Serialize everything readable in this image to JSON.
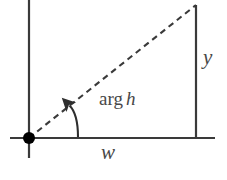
{
  "figure": {
    "background_color": "#ffffff",
    "stroke_color": "#3a3a3a",
    "text_color": "#484848"
  },
  "labels": {
    "y": "y",
    "w": "w",
    "arg_prefix": "arg",
    "arg_variable": "h"
  },
  "geometry": {
    "origin": {
      "x": 29,
      "y": 138
    },
    "vertex": {
      "x": 196,
      "y": 5
    },
    "horizontal_axis": {
      "x1": 10,
      "y1": 138,
      "x2": 215,
      "y2": 138
    },
    "vertical_axis": {
      "x1": 29,
      "y1": 0,
      "x2": 29,
      "y2": 158
    },
    "right_vertical": {
      "x1": 196,
      "y1": 5,
      "x2": 196,
      "y2": 138
    },
    "hypotenuse_dashed": {
      "x1": 29,
      "y1": 138,
      "x2": 196,
      "y2": 5
    },
    "angle_arc_radius": 49,
    "origin_dot_radius": 6
  }
}
